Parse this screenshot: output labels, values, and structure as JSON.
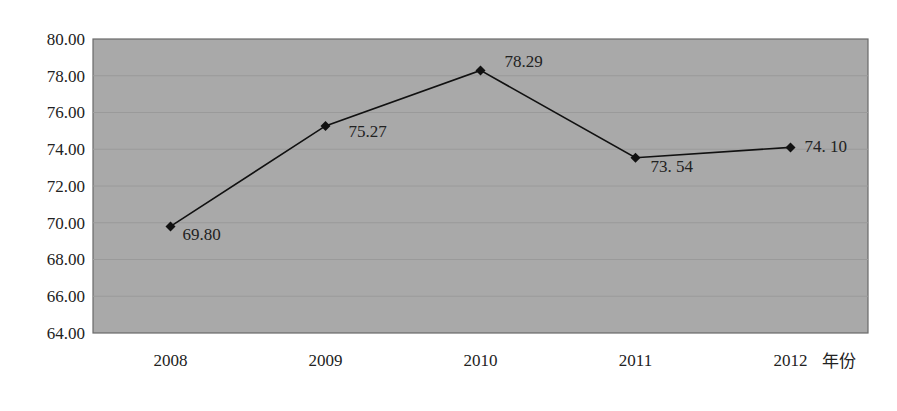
{
  "chart_data": {
    "type": "line",
    "title": "",
    "xlabel": "年份",
    "ylabel": "",
    "categories": [
      "2008",
      "2009",
      "2010",
      "2011",
      "2012"
    ],
    "series": [
      {
        "name": "",
        "values": [
          69.8,
          75.27,
          78.29,
          73.54,
          74.1
        ]
      }
    ],
    "data_labels": [
      "69.80",
      "75.27",
      "78.29",
      "73. 54",
      "74. 10"
    ],
    "ylim": [
      64.0,
      80.0
    ],
    "yticks": [
      "64.00",
      "66.00",
      "68.00",
      "70.00",
      "72.00",
      "74.00",
      "76.00",
      "78.00",
      "80.00"
    ],
    "grid": true,
    "legend": "none",
    "marker": "diamond",
    "plot_background": "#a9a9a9",
    "line_color": "#111111"
  }
}
